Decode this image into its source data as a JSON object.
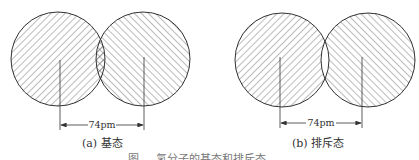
{
  "panels": [
    {
      "id": "a",
      "caption": "(a) 基态",
      "distance_label": "74pm",
      "overlap": "cross-hatched"
    },
    {
      "id": "b",
      "caption": "(b) 排斥态",
      "distance_label": "74pm",
      "overlap": "empty"
    }
  ],
  "figure_caption": "图 ... 氢分子的基态和排斥态",
  "colors": {
    "stroke": "#333333",
    "hatch": "#555555",
    "background": "#ffffff"
  }
}
